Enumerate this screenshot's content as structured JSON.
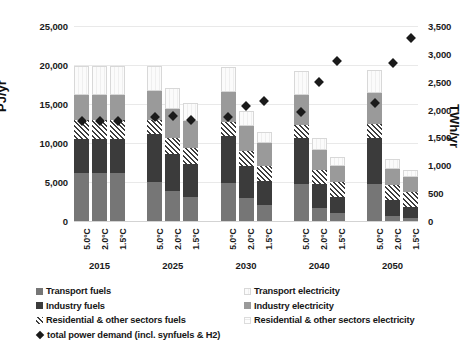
{
  "chart_data": {
    "type": "bar",
    "title": "",
    "subtitle": "",
    "stacked": true,
    "grid": true,
    "ylabel": "PJ/yr",
    "ylabel_secondary": "TWh/yr",
    "xlabel": "",
    "ylim": [
      0,
      25000
    ],
    "ylim_secondary": [
      0,
      3500
    ],
    "yticks": [
      "0",
      "5,000",
      "10,000",
      "15,000",
      "20,000",
      "25,000"
    ],
    "yticks_secondary": [
      "0",
      "500",
      "1,000",
      "1,500",
      "2,000",
      "2,500",
      "3,000",
      "3,500"
    ],
    "ytick_values": [
      0,
      5000,
      10000,
      15000,
      20000,
      25000
    ],
    "ytick_values_secondary": [
      0,
      500,
      1000,
      1500,
      2000,
      2500,
      3000,
      3500
    ],
    "groups": [
      "2015",
      "2025",
      "2030",
      "2040",
      "2050"
    ],
    "scenarios": [
      "5.0°C",
      "2.0°C",
      "1.5°C"
    ],
    "legend_position": "bottom",
    "series": [
      {
        "name": "Transport fuels",
        "key": "transport_fuels",
        "color": "#767676",
        "values": [
          [
            6200,
            6200,
            6200
          ],
          [
            5000,
            3800,
            3100
          ],
          [
            4900,
            2900,
            2100
          ],
          [
            4700,
            1700,
            1000
          ],
          [
            4800,
            700,
            400
          ]
        ]
      },
      {
        "name": "Industry fuels",
        "key": "industry_fuels",
        "color": "#3b3b3b",
        "values": [
          [
            4300,
            4300,
            4300
          ],
          [
            6100,
            4800,
            4200
          ],
          [
            6000,
            4200,
            3000
          ],
          [
            5900,
            3000,
            2100
          ],
          [
            5900,
            2000,
            1400
          ]
        ]
      },
      {
        "name": "Residential & other sectors fuels",
        "key": "resother_fuels",
        "color": "#ffffff",
        "pattern": "diagonal-hatch",
        "values": [
          [
            2400,
            2400,
            2400
          ],
          [
            1900,
            2000,
            2000
          ],
          [
            1800,
            1900,
            2000
          ],
          [
            1700,
            1900,
            1900
          ],
          [
            1700,
            1900,
            1900
          ]
        ]
      },
      {
        "name": "Industry electricity",
        "key": "industry_electricity",
        "color": "#9a9a9a",
        "values": [
          [
            3300,
            3300,
            3300
          ],
          [
            3700,
            3700,
            3500
          ],
          [
            3800,
            3200,
            2900
          ],
          [
            3900,
            2500,
            2100
          ],
          [
            4000,
            2100,
            1900
          ]
        ]
      },
      {
        "name": "Transport electricity",
        "key": "transport_electricity",
        "color": "#fbfbfb",
        "pattern": "vertical-light",
        "values": [
          [
            3700,
            3700,
            3700
          ],
          [
            3200,
            2800,
            2300
          ],
          [
            3200,
            1900,
            1400
          ],
          [
            3100,
            1500,
            1100
          ],
          [
            3000,
            1300,
            1000
          ]
        ]
      },
      {
        "name": "Residential & other sectors electricity",
        "key": "resother_electricity",
        "color": "#fdfdfd",
        "pattern": "grid-light",
        "values": [
          [
            0,
            0,
            0
          ],
          [
            0,
            0,
            0
          ],
          [
            0,
            0,
            0
          ],
          [
            0,
            0,
            0
          ],
          [
            0,
            0,
            0
          ]
        ]
      }
    ],
    "marker_series": {
      "name": "total power demand (incl. synfuels & H2)",
      "key": "total_power_demand",
      "axis": "secondary",
      "unit": "TWh/yr",
      "marker": "diamond",
      "color": "#1a1a1a",
      "values": [
        [
          1790,
          1790,
          1790
        ],
        [
          1860,
          1890,
          1820
        ],
        [
          1870,
          2060,
          2150
        ],
        [
          1960,
          2490,
          2880
        ],
        [
          2110,
          2830,
          3280
        ]
      ]
    }
  },
  "axes": {
    "left_title": "PJ/yr",
    "right_title": "TWh/yr"
  },
  "legend": {
    "left_items": [
      {
        "label": "Transport fuels",
        "swatch": "transport-fuels-swatch"
      },
      {
        "label": "Industry fuels",
        "swatch": "industry-fuels-swatch"
      },
      {
        "label": "Residential & other sectors fuels",
        "swatch": "resother-fuels-swatch"
      },
      {
        "label": "total power demand (incl. synfuels & H2)",
        "swatch": "total-power-demand-marker"
      }
    ],
    "right_items": [
      {
        "label": "Transport electricity",
        "swatch": "transport-electricity-swatch"
      },
      {
        "label": "Industry electricity",
        "swatch": "industry-electricity-swatch"
      },
      {
        "label": "Residential & other sectors electricity",
        "swatch": "resother-electricity-swatch"
      }
    ]
  }
}
